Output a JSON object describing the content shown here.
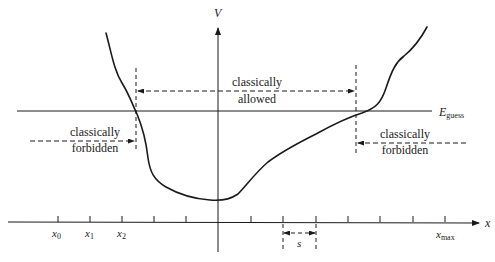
{
  "figure": {
    "axes": {
      "y_label": "V",
      "x_label": "x"
    },
    "energy_line": {
      "label_main": "E",
      "label_sub": "guess"
    },
    "regions": {
      "allowed": {
        "line1": "classically",
        "line2": "allowed"
      },
      "forbidden_left": {
        "line1": "classically",
        "line2": "forbidden"
      },
      "forbidden_right": {
        "line1": "classically",
        "line2": "forbidden"
      }
    },
    "grid_labels": {
      "x0": {
        "main": "x",
        "sub": "0"
      },
      "x1": {
        "main": "x",
        "sub": "1"
      },
      "x2": {
        "main": "x",
        "sub": "2"
      },
      "xmax": {
        "main": "x",
        "sub": "max"
      }
    },
    "step_label": "s",
    "colors": {
      "ink": "#1a1a1a",
      "background": "#ffffff"
    }
  }
}
